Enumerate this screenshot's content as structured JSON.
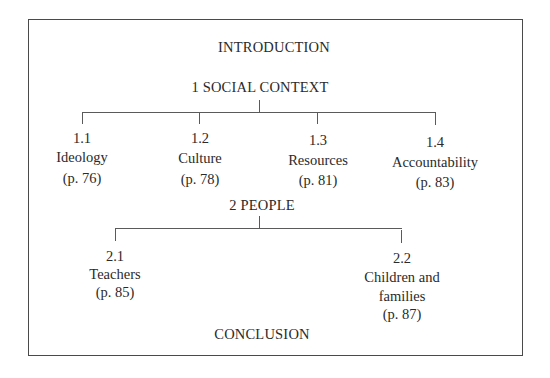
{
  "diagram": {
    "introduction": "INTRODUCTION",
    "conclusion": "CONCLUSION",
    "sections": [
      {
        "title": "1 SOCIAL CONTEXT",
        "children": [
          {
            "number": "1.1",
            "name": "Ideology",
            "page": "(p. 76)"
          },
          {
            "number": "1.2",
            "name": "Culture",
            "page": "(p. 78)"
          },
          {
            "number": "1.3",
            "name": "Resources",
            "page": "(p. 81)"
          },
          {
            "number": "1.4",
            "name": "Accountability",
            "page": "(p. 83)"
          }
        ]
      },
      {
        "title": "2 PEOPLE",
        "children": [
          {
            "number": "2.1",
            "name": "Teachers",
            "page": "(p. 85)"
          },
          {
            "number": "2.2",
            "name_line1": "Children and",
            "name_line2": "families",
            "page": "(p. 87)"
          }
        ]
      }
    ],
    "colors": {
      "line": "#5a5a5a",
      "text": "#2a2a2a",
      "background": "#ffffff"
    }
  }
}
